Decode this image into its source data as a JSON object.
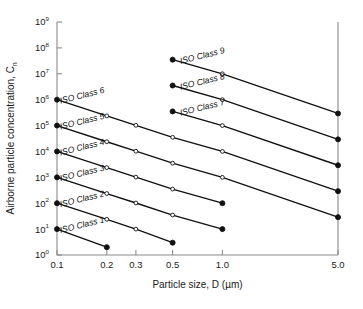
{
  "chart_data": {
    "type": "line",
    "title": "",
    "xlabel": "Particle size, D (µm)",
    "ylabel": "Airborne particle concentration, C",
    "ylabel_subscript": "n",
    "xscale": "log",
    "yscale": "log",
    "xlim": [
      0.1,
      5.0
    ],
    "ylim": [
      1,
      1000000000
    ],
    "grid": false,
    "legend": "inline-labels",
    "xticks": [
      0.1,
      0.2,
      0.3,
      0.5,
      1.0,
      5.0
    ],
    "xtick_labels": [
      "0.1",
      "0.2",
      "0.3",
      "0.5",
      "1.0",
      "5.0"
    ],
    "yticks": [
      1,
      10,
      100,
      1000,
      10000,
      100000,
      1000000,
      10000000,
      100000000,
      1000000000
    ],
    "ytick_labels": [
      {
        "base": "10",
        "exp": "0"
      },
      {
        "base": "10",
        "exp": "1"
      },
      {
        "base": "10",
        "exp": "2"
      },
      {
        "base": "10",
        "exp": "3"
      },
      {
        "base": "10",
        "exp": "4"
      },
      {
        "base": "10",
        "exp": "5"
      },
      {
        "base": "10",
        "exp": "6"
      },
      {
        "base": "10",
        "exp": "7"
      },
      {
        "base": "10",
        "exp": "8"
      },
      {
        "base": "10",
        "exp": "9"
      }
    ],
    "series": [
      {
        "name": "ISO Class 1",
        "label": "ISO Class 1",
        "x": [
          0.1,
          0.2
        ],
        "values": [
          10,
          2
        ]
      },
      {
        "name": "ISO Class 2",
        "label": "ISO Class 2",
        "x": [
          0.1,
          0.2,
          0.3,
          0.5
        ],
        "values": [
          100,
          24,
          10,
          3
        ]
      },
      {
        "name": "ISO Class 3",
        "label": "ISO Class 3",
        "x": [
          0.1,
          0.2,
          0.3,
          0.5,
          1.0
        ],
        "values": [
          1000,
          237,
          102,
          35,
          10
        ]
      },
      {
        "name": "ISO Class 4",
        "label": "ISO Class 4",
        "x": [
          0.1,
          0.2,
          0.3,
          0.5,
          1.0
        ],
        "values": [
          10000,
          2370,
          1020,
          352,
          100
        ]
      },
      {
        "name": "ISO Class 5",
        "label": "ISO Class 5",
        "x": [
          0.1,
          0.2,
          0.3,
          0.5,
          1.0,
          5.0
        ],
        "values": [
          100000,
          23700,
          10200,
          3520,
          1000,
          29
        ]
      },
      {
        "name": "ISO Class 6",
        "label": "ISO Class 6",
        "x": [
          0.1,
          0.2,
          0.3,
          0.5,
          1.0,
          5.0
        ],
        "values": [
          1000000,
          237000,
          102000,
          35200,
          10000,
          293
        ]
      },
      {
        "name": "ISO Class 7",
        "label": "ISO Class 7",
        "x": [
          0.5,
          1.0,
          5.0
        ],
        "values": [
          352000,
          100000,
          2930
        ]
      },
      {
        "name": "ISO Class 8",
        "label": "ISO Class 8",
        "x": [
          0.5,
          1.0,
          5.0
        ],
        "values": [
          3520000,
          1000000,
          29300
        ]
      },
      {
        "name": "ISO Class 9",
        "label": "ISO Class 9",
        "x": [
          0.5,
          1.0,
          5.0
        ],
        "values": [
          35200000,
          10000000,
          293000
        ]
      }
    ],
    "series_label_positions": [
      {
        "name": "ISO Class 1",
        "x": 0.105,
        "y": 7.0,
        "rotate": -14
      },
      {
        "name": "ISO Class 2",
        "x": 0.105,
        "y": 70.0,
        "rotate": -14
      },
      {
        "name": "ISO Class 3",
        "x": 0.105,
        "y": 700.0,
        "rotate": -14
      },
      {
        "name": "ISO Class 4",
        "x": 0.105,
        "y": 7000.0,
        "rotate": -14
      },
      {
        "name": "ISO Class 5",
        "x": 0.105,
        "y": 70000.0,
        "rotate": -14
      },
      {
        "name": "ISO Class 6",
        "x": 0.105,
        "y": 700000.0,
        "rotate": -14
      },
      {
        "name": "ISO Class 7",
        "x": 0.56,
        "y": 240000.0,
        "rotate": -14
      },
      {
        "name": "ISO Class 8",
        "x": 0.56,
        "y": 2400000.0,
        "rotate": -14
      },
      {
        "name": "ISO Class 9",
        "x": 0.56,
        "y": 24000000.0,
        "rotate": -14
      }
    ],
    "colors": {
      "line": "#111111",
      "axis": "#8a8a8a",
      "text": "#1a1a1a",
      "background": "#ffffff"
    }
  }
}
